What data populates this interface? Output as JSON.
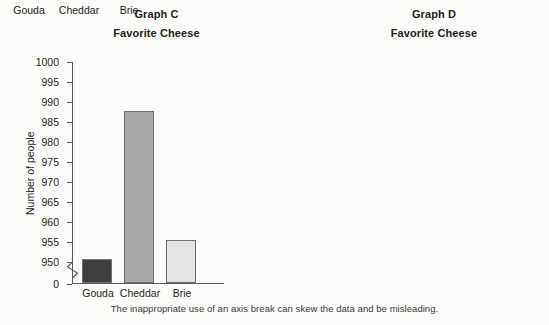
{
  "caption": "The inappropriate use of an axis break can skew the data and be misleading.",
  "colors": {
    "gouda": "#3f3f3f",
    "cheddar": "#a9a9a9",
    "brie": "#e3e3e3",
    "axis": "#58595b",
    "text": "#231f20",
    "background": "#fbfbf9"
  },
  "panels": [
    {
      "id": "graph-c",
      "title": "Graph C",
      "subtitle": "Favorite Cheese",
      "ylabel": "Number of people"
    },
    {
      "id": "graph-d",
      "title": "Graph D",
      "subtitle": "Favorite Cheese",
      "ylabel": "Number of people"
    }
  ],
  "chart_data": [
    {
      "type": "bar",
      "id": "graph-c",
      "title": "Graph C",
      "subtitle": "Favorite Cheese",
      "xlabel": "",
      "ylabel": "Number of people",
      "categories": [
        "Gouda",
        "Cheddar",
        "Brie"
      ],
      "values": [
        950.5,
        987.5,
        955.2
      ],
      "colors": [
        "#3f3f3f",
        "#a9a9a9",
        "#e3e3e3"
      ],
      "yticks": [
        0,
        950,
        955,
        960,
        965,
        970,
        975,
        980,
        985,
        990,
        995,
        1000
      ],
      "ytick_labels": [
        "0",
        "950",
        "955",
        "960",
        "965",
        "970",
        "975",
        "980",
        "985",
        "990",
        "995",
        "1000"
      ],
      "ylim": [
        950,
        1000
      ],
      "axis_break": true,
      "axis_break_between": [
        0,
        950
      ],
      "grid": false,
      "legend": "none"
    },
    {
      "type": "bar",
      "id": "graph-d",
      "title": "Graph D",
      "subtitle": "Favorite Cheese",
      "xlabel": "",
      "ylabel": "Number of people",
      "categories": [
        "Gouda",
        "Cheddar",
        "Brie"
      ],
      "values": [
        940,
        975,
        955
      ],
      "colors": [
        "#3f3f3f",
        "#a9a9a9",
        "#e3e3e3"
      ],
      "yticks": [
        0,
        100,
        200,
        300,
        400,
        500,
        600,
        700,
        800,
        900,
        1000
      ],
      "ytick_labels": [
        "0",
        "100",
        "200",
        "300",
        "400",
        "500",
        "600",
        "700",
        "800",
        "900",
        "1000"
      ],
      "ylim": [
        0,
        1000
      ],
      "axis_break": false,
      "grid": false,
      "legend": "none"
    }
  ]
}
